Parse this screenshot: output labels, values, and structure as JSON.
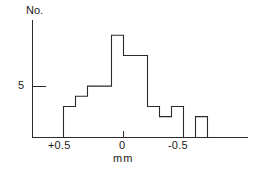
{
  "chart_data": {
    "type": "bar",
    "title": "",
    "subtitle": "",
    "xlabel": "mm",
    "ylabel": "No.",
    "orientation": "vertical",
    "grid": false,
    "legend": false,
    "legend_position": "none",
    "note": "Histogram of deviations in mm; x-axis runs from +0.5 on the left to -0.5 and beyond on the right (reversed direction).",
    "x_axis": {
      "label": "mm",
      "tick_values": [
        0.5,
        0.0,
        -0.5
      ],
      "tick_labels": [
        "+0.5",
        "0",
        "-0.5"
      ],
      "direction": "decreasing-left-to-right",
      "range": [
        0.6,
        -0.8
      ]
    },
    "y_axis": {
      "label": "No.",
      "tick_values": [
        5
      ],
      "tick_labels": [
        "5"
      ],
      "range": [
        0,
        11
      ]
    },
    "bin_width_mm": 0.1,
    "bins": [
      {
        "left_mm": 0.5,
        "right_mm": 0.4,
        "count": 3
      },
      {
        "left_mm": 0.4,
        "right_mm": 0.3,
        "count": 4
      },
      {
        "left_mm": 0.3,
        "right_mm": 0.2,
        "count": 5
      },
      {
        "left_mm": 0.2,
        "right_mm": 0.1,
        "count": 5
      },
      {
        "left_mm": 0.1,
        "right_mm": 0.0,
        "count": 10
      },
      {
        "left_mm": 0.0,
        "right_mm": -0.1,
        "count": 8
      },
      {
        "left_mm": -0.1,
        "right_mm": -0.2,
        "count": 8
      },
      {
        "left_mm": -0.2,
        "right_mm": -0.3,
        "count": 3
      },
      {
        "left_mm": -0.3,
        "right_mm": -0.4,
        "count": 2
      },
      {
        "left_mm": -0.4,
        "right_mm": -0.5,
        "count": 3
      },
      {
        "left_mm": -0.5,
        "right_mm": -0.6,
        "count": 0
      },
      {
        "left_mm": -0.6,
        "right_mm": -0.7,
        "count": 2
      }
    ],
    "categories": [
      "+0.5",
      "+0.4",
      "+0.3",
      "+0.2",
      "+0.1",
      "0.0",
      "-0.1",
      "-0.2",
      "-0.3",
      "-0.4",
      "-0.5",
      "-0.6"
    ],
    "values": [
      3,
      4,
      5,
      5,
      10,
      8,
      8,
      3,
      2,
      3,
      0,
      2
    ],
    "colors": {
      "line": "#2b2b2b",
      "fill": "none",
      "background": "#ffffff"
    }
  },
  "labels": {
    "y_axis_title": "No.",
    "y_tick_5": "5",
    "x_tick_left": "+0.5",
    "x_tick_zero": "0",
    "x_tick_right": "-0.5",
    "x_unit": "mm"
  }
}
